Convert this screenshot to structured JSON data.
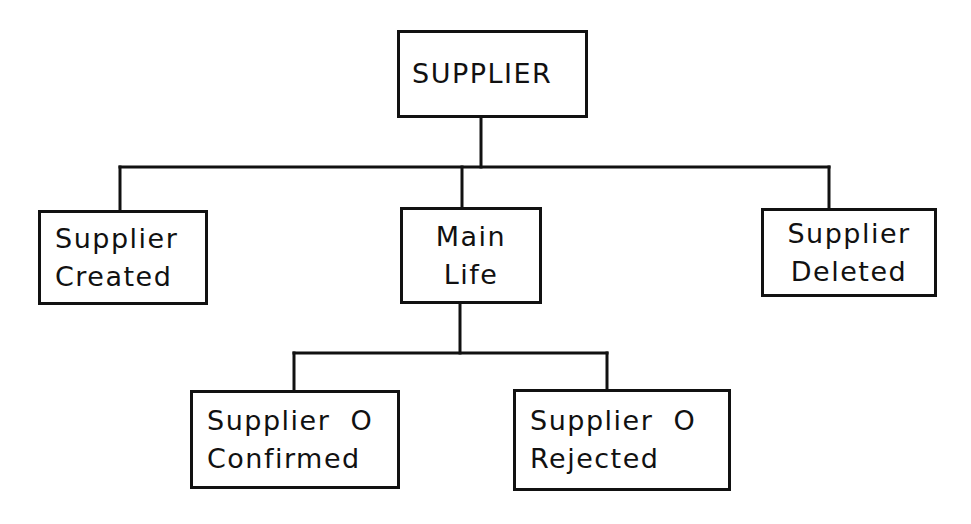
{
  "diagram": {
    "type": "hierarchy-tree",
    "line_color": "#111111",
    "background": "#ffffff",
    "nodes": {
      "root": {
        "id": "supplier",
        "lines": [
          "SUPPLIER"
        ]
      },
      "created": {
        "id": "supplier-created",
        "lines": [
          "Supplier",
          "Created"
        ]
      },
      "main_life": {
        "id": "main-life",
        "lines": [
          "Main",
          "Life"
        ]
      },
      "deleted": {
        "id": "supplier-deleted",
        "lines": [
          "Supplier",
          "Deleted"
        ]
      },
      "confirmed": {
        "id": "supplier-confirmed",
        "lines": [
          "Supplier  O",
          "Confirmed"
        ]
      },
      "rejected": {
        "id": "supplier-rejected",
        "lines": [
          "Supplier  O",
          "Rejected"
        ]
      }
    },
    "edges": [
      {
        "from": "supplier",
        "to": "supplier-created"
      },
      {
        "from": "supplier",
        "to": "main-life"
      },
      {
        "from": "supplier",
        "to": "supplier-deleted"
      },
      {
        "from": "main-life",
        "to": "supplier-confirmed"
      },
      {
        "from": "main-life",
        "to": "supplier-rejected"
      }
    ]
  }
}
